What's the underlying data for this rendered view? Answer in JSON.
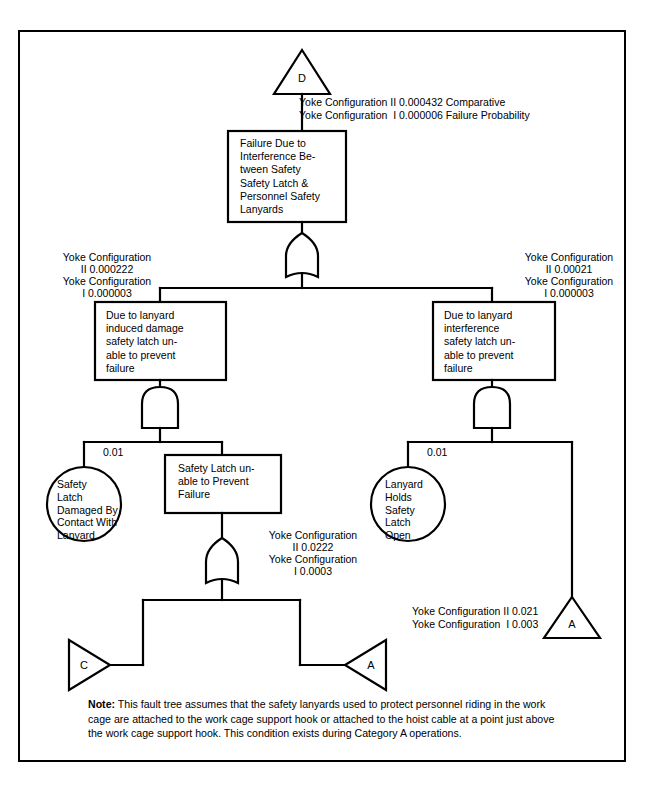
{
  "diagram": {
    "type": "fault-tree",
    "title_symbol": "D",
    "top_transfer_label": "D",
    "top_probability_lines": [
      "Yoke Configuration II 0.000432 Comparative",
      "Yoke Configuration  I 0.000006 Failure Probability"
    ],
    "top_event_box": "Failure Due to\nInterference Be-\ntween Safety\nSafety Latch &\nPersonnel Safety\nLanyards",
    "top_gate": "OR",
    "left_branch": {
      "probability_lines": [
        "Yoke Configuration",
        "II 0.000222",
        "Yoke Configuration",
        "I 0.000003"
      ],
      "box": "Due to lanyard\ninduced damage\nsafety latch un-\nable to prevent\nfailure",
      "gate": "AND",
      "basic_event_probability": "0.01",
      "basic_event_circle": "Safety\nLatch\nDamaged By\nContact With\nLanyard",
      "sub_box": "Safety Latch un-\nable to Prevent\nFailure",
      "sub_box_probability_lines": [
        "Yoke Configuration",
        "II 0.0222",
        "Yoke Configuration",
        "I 0.0003"
      ],
      "sub_gate": "OR",
      "transfer_left": "C",
      "transfer_right": "A"
    },
    "right_branch": {
      "probability_lines": [
        "Yoke Configuration",
        "II 0.00021",
        "Yoke Configuration",
        "I 0.000003"
      ],
      "box": "Due to lanyard\ninterference\nsafety latch un-\nable to prevent\nfailure",
      "gate": "AND",
      "basic_event_probability": "0.01",
      "basic_event_circle": "Lanyard\nHolds\nSafety\nLatch\nOpen",
      "transfer_probability_lines": [
        "Yoke Configuration II 0.021",
        "Yoke Configuration  I 0.003"
      ],
      "transfer_symbol": "A"
    },
    "note": {
      "label": "Note:",
      "text": " This fault tree assumes that the safety lanyards used to protect personnel riding in the work cage are attached to the work cage support hook or attached to the hoist cable at a point just above the work cage support hook. This condition exists during Category A operations."
    },
    "colors": {
      "line": "#000000",
      "background": "#ffffff",
      "text": "#000000"
    }
  }
}
